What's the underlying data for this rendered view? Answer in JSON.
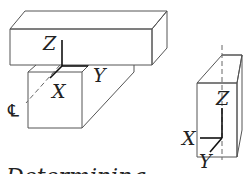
{
  "diagram": {
    "left_assembly": {
      "description": "Horizontal beam resting on a vertical block with coordinate axes at the contact point",
      "axis_labels": {
        "z": "Z",
        "y": "Y",
        "x": "X"
      },
      "centerline_symbol": "℄"
    },
    "right_assembly": {
      "description": "Single vertical block with coordinate axes at the bottom-right corner",
      "axis_labels": {
        "z": "Z",
        "x": "X",
        "y": "Y"
      }
    },
    "caption": "Determining"
  },
  "colors": {
    "line": "#555555",
    "axis": "#111111",
    "text": "#222222",
    "background": "#ffffff"
  }
}
